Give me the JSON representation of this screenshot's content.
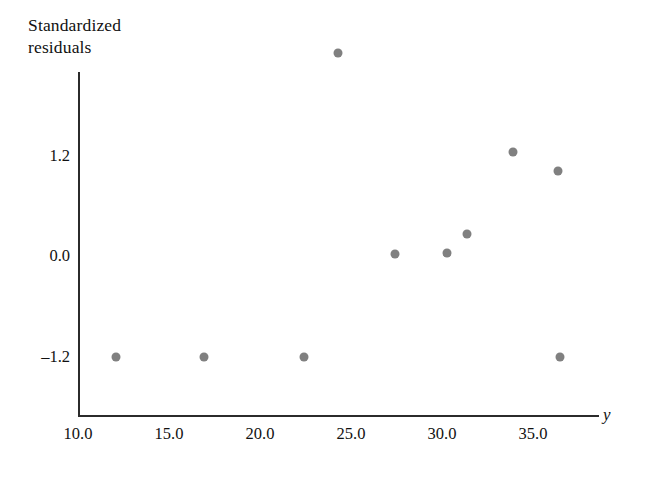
{
  "chart_data": {
    "type": "scatter",
    "title": "",
    "ylabel": "Standardized\nresiduals",
    "xlabel": "y",
    "xlabel_style": "italic",
    "xlim": [
      9.0,
      37.6
    ],
    "ylim": [
      -1.75,
      2.75
    ],
    "grid": false,
    "legend": null,
    "marker_color": "#808080",
    "axis_color": "#2b2b2b",
    "xticks": [
      {
        "value": 10.0,
        "label": "10.0"
      },
      {
        "value": 15.0,
        "label": "15.0"
      },
      {
        "value": 20.0,
        "label": "20.0"
      },
      {
        "value": 25.0,
        "label": "25.0"
      },
      {
        "value": 30.0,
        "label": "30.0"
      },
      {
        "value": 35.0,
        "label": "35.0"
      }
    ],
    "yticks": [
      {
        "value": 1.2,
        "label": "1.2"
      },
      {
        "value": 0.0,
        "label": "0.0"
      },
      {
        "value": -1.2,
        "label": "–1.2"
      }
    ],
    "series": [
      {
        "name": "standardized residuals",
        "color": "#808080",
        "points": [
          {
            "x": 12.1,
            "y": -1.2
          },
          {
            "x": 16.9,
            "y": -1.2
          },
          {
            "x": 22.4,
            "y": -1.2
          },
          {
            "x": 24.3,
            "y": 2.42
          },
          {
            "x": 27.4,
            "y": 0.02
          },
          {
            "x": 30.3,
            "y": 0.04
          },
          {
            "x": 31.4,
            "y": 0.26
          },
          {
            "x": 33.9,
            "y": 1.24
          },
          {
            "x": 36.4,
            "y": 1.01
          },
          {
            "x": 36.5,
            "y": -1.2
          }
        ]
      }
    ]
  }
}
